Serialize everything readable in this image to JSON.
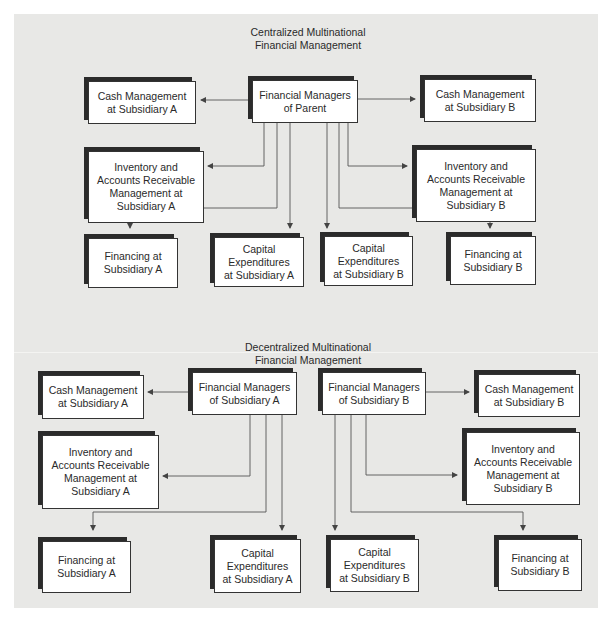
{
  "centralized": {
    "title_line1": "Centralized Multinational",
    "title_line2": "Financial Management",
    "parent": {
      "line1": "Financial Managers",
      "line2": "of Parent"
    },
    "cash_a": {
      "line1": "Cash Management",
      "line2": "at Subsidiary A"
    },
    "cash_b": {
      "line1": "Cash Management",
      "line2": "at Subsidiary B"
    },
    "inv_a": {
      "line1": "Inventory and",
      "line2": "Accounts Receivable",
      "line3": "Management at",
      "line4": "Subsidiary A"
    },
    "inv_b": {
      "line1": "Inventory and",
      "line2": "Accounts Receivable",
      "line3": "Management at",
      "line4": "Subsidiary B"
    },
    "fin_a": {
      "line1": "Financing at",
      "line2": "Subsidiary A"
    },
    "capex_a": {
      "line1": "Capital",
      "line2": "Expenditures",
      "line3": "at Subsidiary A"
    },
    "capex_b": {
      "line1": "Capital",
      "line2": "Expenditures",
      "line3": "at Subsidiary B"
    },
    "fin_b": {
      "line1": "Financing at",
      "line2": "Subsidiary B"
    }
  },
  "decentralized": {
    "title_line1": "Decentralized Multinational",
    "title_line2": "Financial Management",
    "mgr_a": {
      "line1": "Financial Managers",
      "line2": "of Subsidiary A"
    },
    "mgr_b": {
      "line1": "Financial Managers",
      "line2": "of Subsidiary B"
    },
    "cash_a": {
      "line1": "Cash Management",
      "line2": "at Subsidiary A"
    },
    "cash_b": {
      "line1": "Cash Management",
      "line2": "at Subsidiary B"
    },
    "inv_a": {
      "line1": "Inventory and",
      "line2": "Accounts Receivable",
      "line3": "Management at",
      "line4": "Subsidiary A"
    },
    "inv_b": {
      "line1": "Inventory and",
      "line2": "Accounts Receivable",
      "line3": "Management at",
      "line4": "Subsidiary B"
    },
    "fin_a": {
      "line1": "Financing at",
      "line2": "Subsidiary A"
    },
    "capex_a": {
      "line1": "Capital",
      "line2": "Expenditures",
      "line3": "at Subsidiary A"
    },
    "capex_b": {
      "line1": "Capital",
      "line2": "Expenditures",
      "line3": "at Subsidiary B"
    },
    "fin_b": {
      "line1": "Financing at",
      "line2": "Subsidiary B"
    }
  },
  "colors": {
    "panel": "#e8e8e6",
    "box_border": "#333333",
    "shadow": "#2b2b2b",
    "wire": "#555555"
  }
}
